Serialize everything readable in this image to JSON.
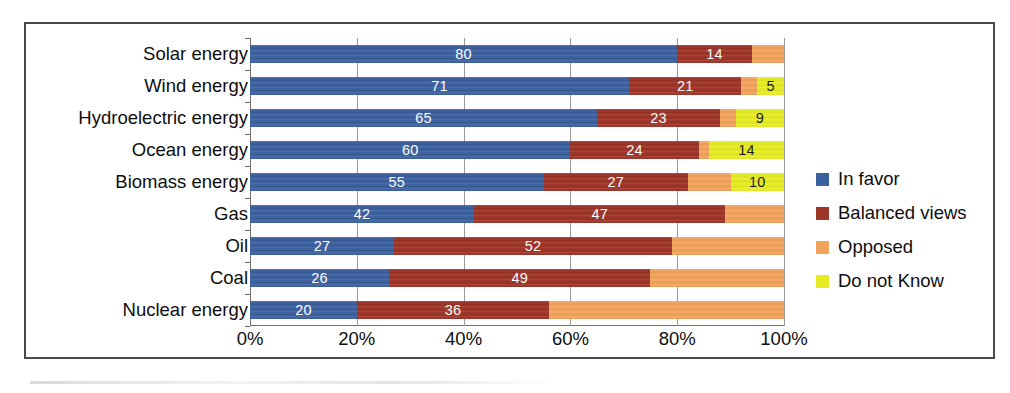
{
  "chart_data": {
    "type": "bar",
    "subtype": "stacked-horizontal-100percent",
    "title": "",
    "xlabel": "",
    "ylabel": "",
    "xlim": [
      0,
      100
    ],
    "xticks": [
      "0%",
      "20%",
      "40%",
      "60%",
      "80%",
      "100%"
    ],
    "xtick_values": [
      0,
      20,
      40,
      60,
      80,
      100
    ],
    "grid": true,
    "legend_position": "right",
    "categories": [
      "Solar energy",
      "Wind energy",
      "Hydroelectric energy",
      "Ocean energy",
      "Biomass energy",
      "Gas",
      "Oil",
      "Coal",
      "Nuclear energy"
    ],
    "series": [
      {
        "name": "In favor",
        "color": "#3c619f",
        "values": [
          80,
          71,
          65,
          60,
          55,
          42,
          27,
          26,
          20
        ]
      },
      {
        "name": "Balanced views",
        "color": "#9e3529",
        "values": [
          14,
          21,
          23,
          24,
          27,
          47,
          52,
          49,
          36
        ]
      },
      {
        "name": "Opposed",
        "color": "#f2a35c",
        "values": [
          6,
          3,
          3,
          2,
          8,
          11,
          21,
          25,
          44
        ]
      },
      {
        "name": "Do not Know",
        "color": "#e6ec23",
        "values": [
          0,
          5,
          9,
          14,
          10,
          0,
          0,
          0,
          0
        ]
      }
    ],
    "value_labels": {
      "Solar energy": [
        "80",
        "14",
        "",
        ""
      ],
      "Wind energy": [
        "71",
        "21",
        "",
        "5"
      ],
      "Hydroelectric energy": [
        "65",
        "23",
        "",
        "9"
      ],
      "Ocean energy": [
        "60",
        "24",
        "",
        "14"
      ],
      "Biomass energy": [
        "55",
        "27",
        "",
        "10"
      ],
      "Gas": [
        "42",
        "47",
        "",
        ""
      ],
      "Oil": [
        "27",
        "52",
        "",
        ""
      ],
      "Coal": [
        "26",
        "49",
        "",
        ""
      ],
      "Nuclear energy": [
        "20",
        "36",
        "",
        ""
      ]
    }
  },
  "legend": {
    "items": [
      {
        "label": "In favor",
        "color": "#3c619f"
      },
      {
        "label": "Balanced views",
        "color": "#9e3529"
      },
      {
        "label": "Opposed",
        "color": "#f2a35c"
      },
      {
        "label": "Do not Know",
        "color": "#e6ec23"
      }
    ]
  }
}
